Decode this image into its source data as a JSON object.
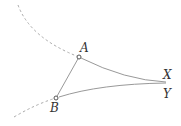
{
  "diagram": {
    "points": [
      {
        "id": "A",
        "label": "A",
        "x": 79,
        "y": 57
      },
      {
        "id": "B",
        "label": "B",
        "x": 56,
        "y": 98
      }
    ],
    "ideal_points": [
      {
        "id": "X",
        "label": "X"
      },
      {
        "id": "Y",
        "label": "Y"
      }
    ],
    "colors": {
      "solid": "#999999",
      "dashed": "#aaaaaa",
      "label": "#333333"
    }
  }
}
